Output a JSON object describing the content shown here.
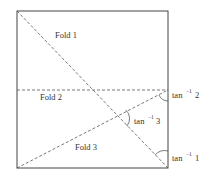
{
  "diagram": {
    "type": "folded-square",
    "square": {
      "x": 17,
      "y": 11,
      "width": 151,
      "height": 157
    },
    "folds": [
      {
        "label": "Fold 1",
        "from": [
          17,
          11
        ],
        "to": [
          168,
          168
        ]
      },
      {
        "label": "Fold 2",
        "from": [
          17,
          90
        ],
        "to": [
          168,
          90
        ]
      },
      {
        "label": "Fold 3",
        "from": [
          17,
          168
        ],
        "to": [
          168,
          90
        ]
      }
    ],
    "labels": {
      "fold1": "Fold 1",
      "fold2": "Fold 2",
      "fold3": "Fold 3"
    },
    "angles": [
      {
        "prefix": "tan",
        "exp": "−1",
        "value": "2"
      },
      {
        "prefix": "tan",
        "exp": "−1",
        "value": "3"
      },
      {
        "prefix": "tan",
        "exp": "−1",
        "value": "1"
      }
    ],
    "colors": {
      "line": "#444444",
      "text": "#333333",
      "background": "#ffffff"
    }
  }
}
